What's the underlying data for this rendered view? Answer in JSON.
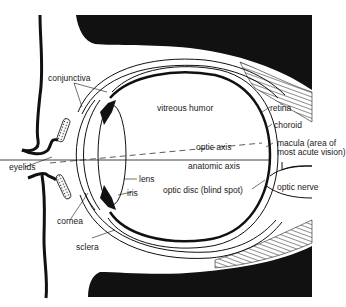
{
  "figure": {
    "labels": {
      "conjunctiva": "conjunctiva",
      "vitreous_humor": "vitreous humor",
      "retina": "retina",
      "choroid": "choroid",
      "macula_line1": "macula (area of",
      "macula_line2": "most acute vision)",
      "optic_axis": "optic axis",
      "anatomic_axis": "anatomic axis",
      "eyelids": "eyelids",
      "lens": "lens",
      "iris": "iris",
      "optic_disc": "optic disc (blind spot)",
      "optic_nerve": "optic nerve",
      "cornea": "cornea",
      "sclera": "sclera"
    },
    "colors": {
      "ink": "#111111",
      "background": "#ffffff"
    }
  }
}
